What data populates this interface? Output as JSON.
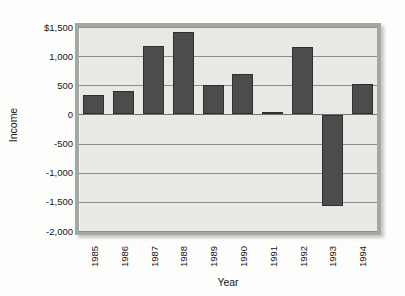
{
  "chart_data": {
    "type": "bar",
    "title": "",
    "xlabel": "Year",
    "ylabel": "Income",
    "categories": [
      "1985",
      "1986",
      "1987",
      "1988",
      "1989",
      "1990",
      "1991",
      "1992",
      "1993",
      "1994"
    ],
    "values": [
      330,
      400,
      1180,
      1420,
      500,
      700,
      30,
      1160,
      -1550,
      520
    ],
    "ylim": [
      -2000,
      1500
    ],
    "yticks": [
      {
        "label": "$1,500",
        "value": 1500
      },
      {
        "label": "1,000",
        "value": 1000
      },
      {
        "label": "500",
        "value": 500
      },
      {
        "label": "0",
        "value": 0
      },
      {
        "label": "-500",
        "value": -500
      },
      {
        "label": "-1,000",
        "value": -1000
      },
      {
        "label": "-1,500",
        "value": -1500
      },
      {
        "label": "-2,000",
        "value": -2000
      }
    ],
    "grid": true,
    "legend": "none",
    "colors": {
      "bar_fill": "#4b4d4c",
      "bar_border": "#2e302f",
      "plot_background": "#e9e8e4",
      "frame": "#a4a8a3",
      "gridline": "#8c8c8a",
      "text": "#161616"
    }
  }
}
